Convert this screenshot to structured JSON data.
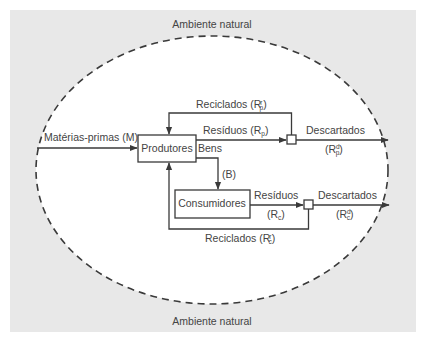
{
  "diagram": {
    "environment_label_top": "Ambiente natural",
    "environment_label_bottom": "Ambiente natural",
    "nodes": {
      "producers": "Produtores",
      "consumers": "Consumidores"
    },
    "flows": {
      "raw_materials": "Matérias-primas (M)",
      "goods": "Bens",
      "goods_symbol": "(B)",
      "producer_recycled": "Reciclados (R",
      "producer_recycled_sup": "r",
      "producer_recycled_sub": "p",
      "producer_waste": "Resíduos (R",
      "producer_waste_sub": "p",
      "producer_discarded": "Descartados",
      "producer_discarded_sym": "(R",
      "producer_discarded_sup": "d",
      "producer_discarded_sub": "p",
      "consumer_waste": "Resíduos",
      "consumer_waste_sym": "(R",
      "consumer_waste_sub": "c",
      "consumer_discarded": "Descartados",
      "consumer_discarded_sym": "(R",
      "consumer_discarded_sup": "d",
      "consumer_discarded_sub": "c",
      "consumer_recycled": "Reciclados (R",
      "consumer_recycled_sup": "r",
      "consumer_recycled_sub": "c",
      "close_paren": ")"
    },
    "colors": {
      "background": "#e8e8e8",
      "ellipse_fill": "#ffffff",
      "line": "#3a3a3a",
      "text": "#444444"
    }
  }
}
